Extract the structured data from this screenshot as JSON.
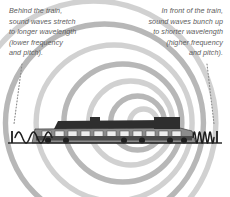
{
  "figure": {
    "background_color": "#ffffff"
  },
  "captions": {
    "left": {
      "text": "Behind the train,\nsound waves stretch\nto longer wavelength\n(lower frequency\nand pitch).",
      "align": "left",
      "color": "#5d5d5d",
      "style": "italic"
    },
    "right": {
      "text": "In front of the train,\nsound waves bunch up\nto shorter wavelength\n(higher frequency\nand pitch).",
      "align": "right",
      "color": "#5d5d5d",
      "style": "italic"
    }
  },
  "leader_lines": {
    "left": {
      "from_x": 22,
      "from_y": 64,
      "to_x": 14,
      "to_y": 124,
      "style": "dotted",
      "color": "#8a8a8a"
    },
    "right": {
      "from_x": 207,
      "from_y": 64,
      "to_x": 214,
      "to_y": 124,
      "style": "dotted",
      "color": "#8a8a8a"
    }
  },
  "sound_waves": {
    "description": "concentric wavefronts emitted by the moving train, compressed ahead and stretched behind",
    "center_x": 150,
    "center_y": 123,
    "band_color_dark": "#b3b3b3",
    "band_color_light": "#cfcfcf",
    "radii": [
      14,
      27,
      42,
      59,
      78,
      99,
      122
    ],
    "compression_factor": 0.46
  },
  "waveform_left": {
    "label": "long-wavelength wave behind the train",
    "cycles": 2.5,
    "x_start": 15,
    "x_end": 52,
    "amplitude": 11,
    "baseline_y": 143,
    "color": "#1d1d1d",
    "tick_x": 12
  },
  "waveform_right": {
    "label": "short-wavelength wave in front of the train",
    "cycles": 4,
    "x_start": 193,
    "x_end": 214,
    "amplitude": 11,
    "baseline_y": 143,
    "color": "#1d1d1d",
    "tick_x": 217
  },
  "ground": {
    "y": 143,
    "x_start": 8,
    "x_end": 222,
    "color": "#2b2b2b"
  },
  "train": {
    "label": "diesel locomotive, side view, facing right",
    "x_left": 32,
    "x_right": 196,
    "body_top_y": 122,
    "baseline_y": 143,
    "body_color": "#8c8c8c",
    "roof_color": "#2e2e2e",
    "detail_color": "#4a4a4a"
  }
}
